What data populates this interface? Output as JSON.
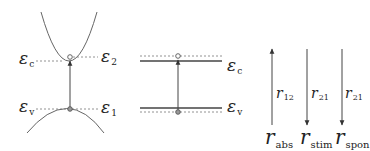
{
  "diagram": {
    "colors": {
      "line": "#555555",
      "dotted": "#777777",
      "text": "#222222",
      "background": "#ffffff"
    },
    "band_panel": {
      "conduction_label": {
        "symbol": "ε",
        "sub": "c"
      },
      "upper_state_label": {
        "symbol": "ε",
        "sub": "2"
      },
      "valence_label": {
        "symbol": "ε",
        "sub": "v"
      },
      "lower_state_label": {
        "symbol": "ε",
        "sub": "1"
      }
    },
    "level_panel": {
      "conduction_label": {
        "symbol": "ε",
        "sub": "c"
      },
      "valence_label": {
        "symbol": "ε",
        "sub": "v"
      }
    },
    "rates_panel": {
      "arrows": [
        {
          "direction": "up",
          "label": {
            "symbol": "r",
            "sub": "12"
          },
          "name": {
            "symbol": "r",
            "sub": "abs"
          }
        },
        {
          "direction": "down",
          "label": {
            "symbol": "r",
            "sub": "21"
          },
          "name": {
            "symbol": "r",
            "sub": "stim"
          }
        },
        {
          "direction": "down",
          "label": {
            "symbol": "r",
            "sub": "21"
          },
          "name": {
            "symbol": "r",
            "sub": "spon"
          }
        }
      ]
    }
  }
}
